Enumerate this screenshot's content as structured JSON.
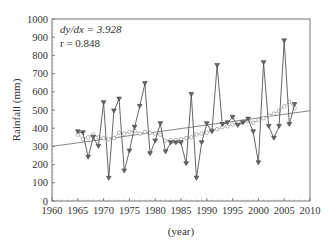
{
  "chart_data": {
    "type": "line",
    "title": "",
    "xlabel": "(year)",
    "ylabel": "Rainfall (mm)",
    "xlim": [
      1960,
      2010
    ],
    "ylim": [
      0,
      1000
    ],
    "x_ticks": [
      "1960",
      "1965",
      "1970",
      "1975",
      "1980",
      "1985",
      "1990",
      "1995",
      "2000",
      "2005",
      "2010"
    ],
    "y_ticks": [
      "0",
      "100",
      "200",
      "300",
      "400",
      "500",
      "600",
      "700",
      "800",
      "900",
      "1000"
    ],
    "grid": false,
    "legend": null,
    "annotations": [
      "dy/dx = 3.928",
      "r = 0.848"
    ],
    "x": [
      1965,
      1966,
      1967,
      1968,
      1969,
      1970,
      1971,
      1972,
      1973,
      1974,
      1975,
      1976,
      1977,
      1978,
      1979,
      1980,
      1981,
      1982,
      1983,
      1984,
      1985,
      1986,
      1987,
      1988,
      1989,
      1990,
      1991,
      1992,
      1993,
      1994,
      1995,
      1996,
      1997,
      1998,
      1999,
      2000,
      2001,
      2002,
      2003,
      2004,
      2005,
      2006,
      2007
    ],
    "series": [
      {
        "name": "Annual rainfall",
        "marker": "triangle-down",
        "color": "#444444",
        "values": [
          380,
          375,
          240,
          350,
          300,
          540,
          125,
          495,
          560,
          165,
          275,
          405,
          520,
          645,
          260,
          330,
          425,
          270,
          320,
          320,
          320,
          205,
          585,
          125,
          320,
          425,
          380,
          745,
          420,
          430,
          460,
          415,
          430,
          450,
          380,
          210,
          760,
          410,
          345,
          410,
          880,
          420,
          530
        ]
      },
      {
        "name": "Moving average",
        "marker": "circle-open",
        "color": "#999999",
        "values": [
          365,
          340,
          350,
          365,
          350,
          345,
          340,
          345,
          375,
          370,
          380,
          385,
          370,
          380,
          375,
          370,
          365,
          330,
          335,
          335,
          340,
          345,
          350,
          365,
          370,
          375,
          390,
          395,
          405,
          410,
          420,
          425,
          435,
          440,
          430,
          445,
          455,
          470,
          480,
          495,
          520,
          545,
          510
        ]
      },
      {
        "name": "Linear trend",
        "type": "line",
        "color": "#888888",
        "x": [
          1960,
          2010
        ],
        "values": [
          300,
          496
        ]
      }
    ]
  }
}
